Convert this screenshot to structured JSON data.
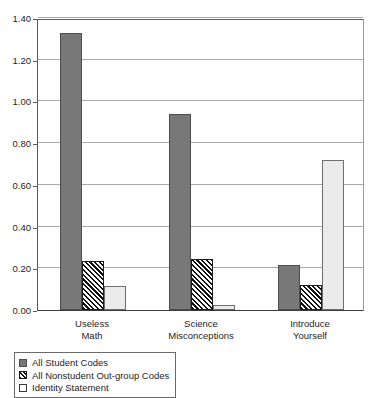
{
  "chart_data": {
    "type": "bar",
    "title": "",
    "subtitle": "",
    "xlabel": "",
    "ylabel": "",
    "ylim": [
      0.0,
      1.4
    ],
    "ytick_labels": [
      "0.00",
      "0.20",
      "0.40",
      "0.60",
      "0.80",
      "1.00",
      "1.20",
      "1.40"
    ],
    "ytick_values": [
      0.0,
      0.2,
      0.4,
      0.6,
      0.8,
      1.0,
      1.2,
      1.4
    ],
    "grid": true,
    "legend_position": "bottom-left",
    "categories": [
      "Useless Math",
      "Science Misconceptions",
      "Introduce Yourself"
    ],
    "category_lines": [
      [
        "Useless",
        "Math"
      ],
      [
        "Science",
        "Misconceptions"
      ],
      [
        "Introduce",
        "Yourself"
      ]
    ],
    "series": [
      {
        "name": "All Student Codes",
        "color": "#787878",
        "pattern": "solid",
        "values": [
          1.33,
          0.94,
          0.215
        ]
      },
      {
        "name": "All Nonstudent Out-group Codes",
        "color": "#111111",
        "pattern": "diagonal-hatch",
        "values": [
          0.235,
          0.245,
          0.12
        ]
      },
      {
        "name": "Identity Statement",
        "color": "#ebebeb",
        "pattern": "solid",
        "values": [
          0.115,
          0.025,
          0.72
        ]
      }
    ]
  },
  "legend": {
    "items": [
      {
        "label": "All Student Codes"
      },
      {
        "label": "All Nonstudent Out-group Codes"
      },
      {
        "label": "Identity Statement"
      }
    ]
  }
}
